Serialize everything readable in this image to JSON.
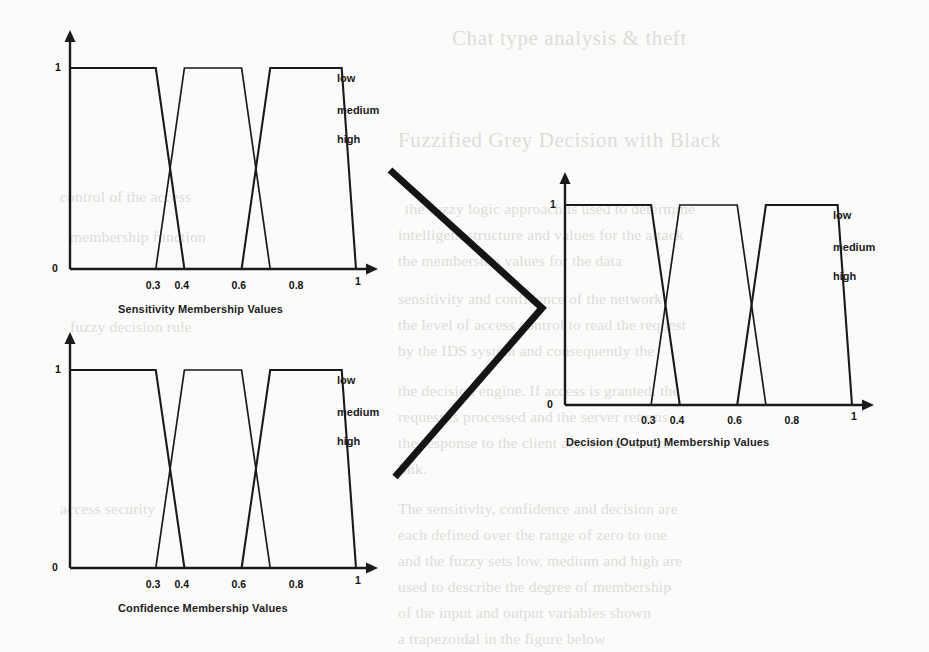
{
  "page": {
    "background_color": "#fbfbfa",
    "ink_color": "#1a1a1a",
    "bleed_color": "#d9d7d2"
  },
  "background_text": {
    "description": "Faint bleed-through text from the reverse side of the scanned page",
    "lines": [
      {
        "text": "Chat type analysis & theft",
        "x": 452,
        "y": 26,
        "size": "big"
      },
      {
        "text": "Fuzzified Grey Decision with Black",
        "x": 398,
        "y": 128,
        "size": "big"
      },
      {
        "text": "the fuzzy logic approach is used to determine",
        "x": 405,
        "y": 200,
        "size": "body"
      },
      {
        "text": "intelligent structure and values for the attack",
        "x": 398,
        "y": 226,
        "size": "body"
      },
      {
        "text": "the membership values for the data",
        "x": 398,
        "y": 252,
        "size": "body"
      },
      {
        "text": "sensitivity and confidence of the network",
        "x": 398,
        "y": 290,
        "size": "body"
      },
      {
        "text": "the level of access control to read the request",
        "x": 398,
        "y": 316,
        "size": "body"
      },
      {
        "text": "by the IDS system and consequently the",
        "x": 398,
        "y": 342,
        "size": "body"
      },
      {
        "text": "the decision engine. If access is granted, the",
        "x": 398,
        "y": 382,
        "size": "body"
      },
      {
        "text": "request is processed and the server returns",
        "x": 398,
        "y": 408,
        "size": "body"
      },
      {
        "text": "the response to the client across the secure",
        "x": 398,
        "y": 434,
        "size": "body"
      },
      {
        "text": "link.",
        "x": 398,
        "y": 460,
        "size": "body"
      },
      {
        "text": "The sensitivity, confidence and decision are",
        "x": 398,
        "y": 500,
        "size": "body"
      },
      {
        "text": "each defined over the range of zero to one",
        "x": 398,
        "y": 526,
        "size": "body"
      },
      {
        "text": "and the fuzzy sets low, medium and high are",
        "x": 398,
        "y": 552,
        "size": "body"
      },
      {
        "text": "used to describe the degree of membership",
        "x": 398,
        "y": 578,
        "size": "body"
      },
      {
        "text": "of the input and output variables shown",
        "x": 398,
        "y": 604,
        "size": "body"
      },
      {
        "text": "a trapezoidal in the figure below",
        "x": 398,
        "y": 630,
        "size": "body"
      },
      {
        "text": "control of the access",
        "x": 60,
        "y": 188,
        "size": "body"
      },
      {
        "text": "membership function",
        "x": 70,
        "y": 228,
        "size": "body"
      },
      {
        "text": "fuzzy decision rule",
        "x": 70,
        "y": 318,
        "size": "body"
      },
      {
        "text": "access security",
        "x": 60,
        "y": 500,
        "size": "body"
      }
    ]
  },
  "connector": {
    "name": "chevron-arrow",
    "points": "390,170 542,308 395,477",
    "stroke_color": "#141414",
    "stroke_width": 7
  },
  "charts": [
    {
      "id": "sensitivity",
      "caption": "Sensitivity Membership Values",
      "legend": [
        "low",
        "medium",
        "high"
      ],
      "y_ticks": [
        "0",
        "1"
      ],
      "x_ticks": [
        "0.3",
        "0.4",
        "0.6",
        "0.8",
        "1"
      ],
      "chart_data": {
        "type": "line",
        "title": "Sensitivity Membership Values",
        "xlabel": "",
        "ylabel": "",
        "xlim": [
          0,
          1
        ],
        "ylim": [
          0,
          1
        ],
        "grid": false,
        "legend_position": "right",
        "xticks": [
          0.3,
          0.4,
          0.6,
          0.8,
          1
        ],
        "yticks": [
          0,
          1
        ],
        "series": [
          {
            "name": "low",
            "x": [
              0.0,
              0.3,
              0.4
            ],
            "y": [
              1,
              1,
              0
            ]
          },
          {
            "name": "medium",
            "x": [
              0.3,
              0.4,
              0.6,
              0.7
            ],
            "y": [
              0,
              1,
              1,
              0
            ]
          },
          {
            "name": "high",
            "x": [
              0.6,
              0.7,
              0.95,
              1.0
            ],
            "y": [
              0,
              1,
              1,
              0
            ]
          }
        ]
      }
    },
    {
      "id": "confidence",
      "caption": "Confidence Membership Values",
      "legend": [
        "low",
        "medium",
        "high"
      ],
      "y_ticks": [
        "0",
        "1"
      ],
      "x_ticks": [
        "0.3",
        "0.4",
        "0.6",
        "0.8",
        "1"
      ],
      "chart_data": {
        "type": "line",
        "title": "Confidence Membership Values",
        "xlabel": "",
        "ylabel": "",
        "xlim": [
          0,
          1
        ],
        "ylim": [
          0,
          1
        ],
        "grid": false,
        "legend_position": "right",
        "xticks": [
          0.3,
          0.4,
          0.6,
          0.8,
          1
        ],
        "yticks": [
          0,
          1
        ],
        "series": [
          {
            "name": "low",
            "x": [
              0.0,
              0.3,
              0.4
            ],
            "y": [
              1,
              1,
              0
            ]
          },
          {
            "name": "medium",
            "x": [
              0.3,
              0.4,
              0.6,
              0.7
            ],
            "y": [
              0,
              1,
              1,
              0
            ]
          },
          {
            "name": "high",
            "x": [
              0.6,
              0.7,
              0.95,
              1.0
            ],
            "y": [
              0,
              1,
              1,
              0
            ]
          }
        ]
      }
    },
    {
      "id": "decision",
      "caption": "Decision (Output) Membership Values",
      "legend": [
        "low",
        "medium",
        "high"
      ],
      "y_ticks": [
        "0",
        "1"
      ],
      "x_ticks": [
        "0.3",
        "0.4",
        "0.6",
        "0.8",
        "1"
      ],
      "chart_data": {
        "type": "line",
        "title": "Decision (Output) Membership Values",
        "xlabel": "",
        "ylabel": "",
        "xlim": [
          0,
          1
        ],
        "ylim": [
          0,
          1
        ],
        "grid": false,
        "legend_position": "right",
        "xticks": [
          0.3,
          0.4,
          0.6,
          0.8,
          1
        ],
        "yticks": [
          0,
          1
        ],
        "series": [
          {
            "name": "low",
            "x": [
              0.0,
              0.3,
              0.4
            ],
            "y": [
              1,
              1,
              0
            ]
          },
          {
            "name": "medium",
            "x": [
              0.3,
              0.4,
              0.6,
              0.7
            ],
            "y": [
              0,
              1,
              1,
              0
            ]
          },
          {
            "name": "high",
            "x": [
              0.6,
              0.7,
              0.95,
              1.0
            ],
            "y": [
              0,
              1,
              1,
              0
            ]
          }
        ]
      }
    }
  ]
}
